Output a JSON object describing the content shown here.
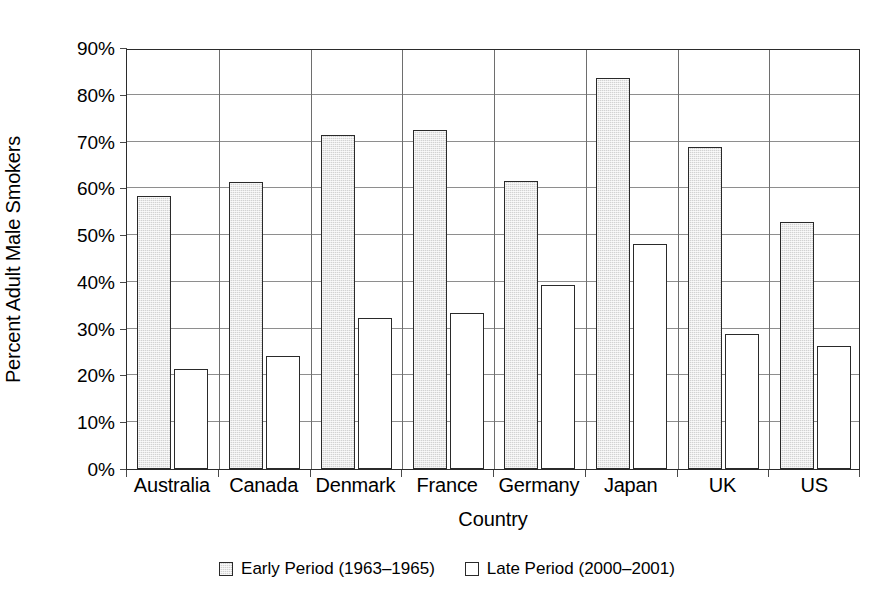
{
  "chart_data": {
    "type": "bar",
    "title": "",
    "xlabel": "Country",
    "ylabel": "Percent Adult Male Smokers",
    "categories": [
      "Australia",
      "Canada",
      "Denmark",
      "France",
      "Germany",
      "Japan",
      "UK",
      "US"
    ],
    "series": [
      {
        "name": "Early Period (1963–1965)",
        "color": "#d2d2d2",
        "values": [
          58.4,
          61.3,
          71.5,
          72.4,
          61.6,
          83.6,
          68.8,
          52.8
        ]
      },
      {
        "name": "Late Period (2000–2001)",
        "color": "#ffffff",
        "values": [
          21.4,
          24.2,
          32.2,
          33.4,
          39.4,
          48.2,
          28.8,
          26.4
        ]
      }
    ],
    "ylim": [
      0,
      90
    ],
    "ytick_labels": [
      "0%",
      "10%",
      "20%",
      "30%",
      "40%",
      "50%",
      "60%",
      "70%",
      "80%",
      "90%"
    ],
    "ytick_values": [
      0,
      10,
      20,
      30,
      40,
      50,
      60,
      70,
      80,
      90
    ],
    "grid": "horizontal",
    "legend_position": "bottom-center",
    "annotations": []
  },
  "legend": {
    "entries": [
      {
        "label": "Early Period (1963–1965)",
        "swatch": "early"
      },
      {
        "label": "Late Period (2000–2001)",
        "swatch": "late"
      }
    ]
  }
}
